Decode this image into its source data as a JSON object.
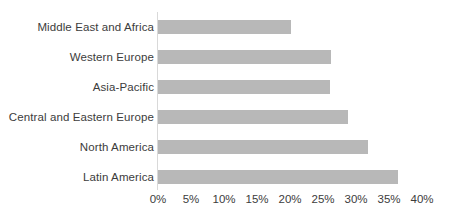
{
  "chart_data": {
    "type": "bar",
    "orientation": "horizontal",
    "title": "",
    "subtitle": "",
    "xlabel": "",
    "ylabel": "",
    "categories": [
      "Middle East and Africa",
      "Western Europe",
      "Asia-Pacific",
      "Central and Eastern Europe",
      "North America",
      "Latin America"
    ],
    "values": [
      20.2,
      26.2,
      26.0,
      28.8,
      31.8,
      36.4
    ],
    "value_suffix": "%",
    "xlim": [
      0,
      40
    ],
    "xticks": [
      0,
      5,
      10,
      15,
      20,
      25,
      30,
      35,
      40
    ],
    "xtick_labels": [
      "0%",
      "5%",
      "10%",
      "15%",
      "20%",
      "25%",
      "30%",
      "35%",
      "40%"
    ],
    "grid": false,
    "legend": false,
    "legend_position": "none",
    "bar_color": "#b8b8b8",
    "axis_color": "#d9d9d9",
    "text_color": "#3c3c3c",
    "background_color": "#ffffff"
  }
}
